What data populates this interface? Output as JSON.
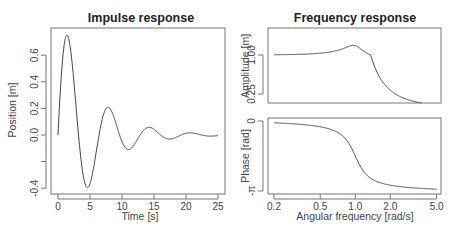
{
  "chart_data": [
    {
      "type": "line",
      "title": "Impulse response",
      "xlabel": "Time [s]",
      "ylabel": "Position [m]",
      "xlim": [
        0,
        25
      ],
      "ylim": [
        -0.4,
        0.75
      ],
      "xticks": [
        "0",
        "5",
        "10",
        "15",
        "20",
        "25"
      ],
      "yticks": [
        "-0.4",
        "",
        "0.0",
        "0.2",
        "0.4",
        "0.6"
      ],
      "grid": false,
      "model": {
        "omega_n": 1.0,
        "zeta": 0.2,
        "kind": "second-order impulse response"
      },
      "x": [
        0,
        1.3,
        4.5,
        7.7,
        10.9,
        14.1,
        17.3,
        20.5,
        23.7,
        25
      ],
      "values": [
        0.0,
        0.75,
        -0.4,
        0.21,
        -0.11,
        0.06,
        -0.03,
        0.02,
        -0.01,
        0.0
      ]
    },
    {
      "type": "line",
      "title": "Frequency response",
      "xlabel": "Angular frequency [rad/s]",
      "ylabel": "Amplitude [m]",
      "xscale": "log",
      "xlim": [
        0.2,
        5.0
      ],
      "ylim": [
        0.15,
        1.35
      ],
      "xticks": [
        "0.2",
        "0.5",
        "1.0",
        "2.0",
        "5.0"
      ],
      "yticks": [
        "0.25",
        "1.00"
      ],
      "grid": false,
      "x": [
        0.2,
        0.5,
        0.8,
        0.96,
        1.2,
        1.5,
        2.0,
        2.5
      ],
      "values": [
        1.04,
        1.18,
        1.6,
        2.55,
        1.6,
        0.79,
        0.32,
        0.19
      ]
    },
    {
      "type": "line",
      "title": "",
      "xlabel": "Angular frequency [rad/s]",
      "ylabel": "Phase [rad]",
      "xscale": "log",
      "xlim": [
        0.2,
        5.0
      ],
      "ylim": [
        -3.1416,
        0
      ],
      "xticks": [
        "0.2",
        "0.5",
        "1.0",
        "2.0",
        "5.0"
      ],
      "yticks": [
        "-π",
        "0"
      ],
      "grid": false,
      "x": [
        0.2,
        0.5,
        0.8,
        1.0,
        1.25,
        2.0,
        5.0
      ],
      "values": [
        -0.08,
        -0.26,
        -0.73,
        -1.57,
        -2.3,
        -2.88,
        -3.06
      ]
    }
  ],
  "labels": {
    "left_title": "Impulse response",
    "right_title": "Frequency response",
    "left_xlabel": "Time [s]",
    "left_ylabel": "Position [m]",
    "amp_ylabel": "Amplitude [m]",
    "phase_ylabel": "Phase [rad]",
    "right_xlabel": "Angular frequency [rad/s]",
    "left_xticks": [
      "0",
      "5",
      "10",
      "15",
      "20",
      "25"
    ],
    "left_yticks": [
      "-0.4",
      "0.0",
      "0.2",
      "0.4",
      "0.6"
    ],
    "amp_yticks": [
      "0.25",
      "1.00"
    ],
    "phase_yticks": [
      "-π",
      "0"
    ],
    "right_xticks": [
      "0.2",
      "0.5",
      "1.0",
      "2.0",
      "5.0"
    ]
  }
}
